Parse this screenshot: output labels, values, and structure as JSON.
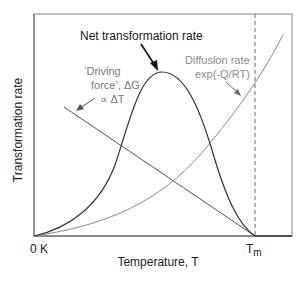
{
  "diagram": {
    "type": "schematic-plot",
    "y_axis_label": "Transformation rate",
    "x_axis_label": "Temperature, T",
    "x_ticks": {
      "origin": "0 K",
      "melting_main": "T",
      "melting_sub": "m"
    },
    "curves": {
      "net": {
        "label": "Net transformation rate",
        "color": "#333333"
      },
      "driving_force": {
        "label_line1": "‘Driving",
        "label_line2": "force’, ΔG",
        "label_line3": "∝  ΔT",
        "color": "#555555"
      },
      "diffusion": {
        "label_line1": "Diffusion rate",
        "label_line2": "exp(-Q/RT)",
        "color": "#8a8a8a"
      }
    },
    "colors": {
      "frame": "#777777",
      "text_dark": "#222222",
      "text_gray": "#7a7a7a",
      "dashed": "#666666"
    }
  }
}
